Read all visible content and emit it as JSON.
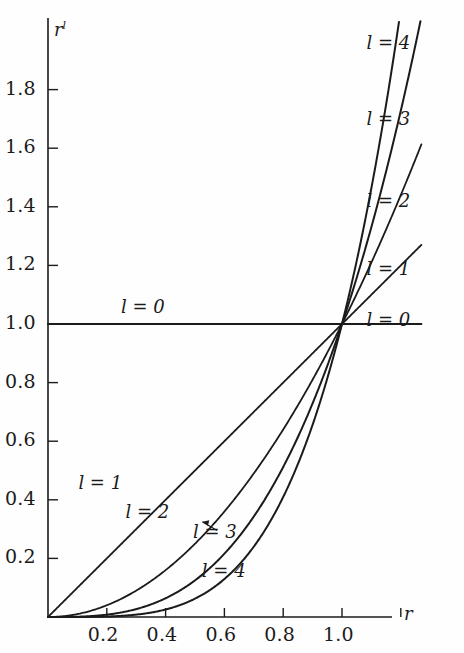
{
  "figure": {
    "background": "#fefefe",
    "ink_color": "#1b1b1b",
    "width": 464,
    "height": 653
  },
  "axes": {
    "x_label": "r",
    "y_label_base": "r",
    "y_label_exponent": "l",
    "x_ticks": [
      {
        "value": 0.2,
        "label": "0.2"
      },
      {
        "value": 0.4,
        "label": "0.4"
      },
      {
        "value": 0.6,
        "label": "0.6"
      },
      {
        "value": 0.8,
        "label": "0.8"
      },
      {
        "value": 1.0,
        "label": "1.0"
      },
      {
        "value": 1.2,
        "label": ""
      }
    ],
    "y_ticks": [
      {
        "value": 0.2,
        "label": "0.2"
      },
      {
        "value": 0.4,
        "label": "0.4"
      },
      {
        "value": 0.6,
        "label": "0.6"
      },
      {
        "value": 0.8,
        "label": "0.8"
      },
      {
        "value": 1.0,
        "label": "1.0"
      },
      {
        "value": 1.2,
        "label": "1.2"
      },
      {
        "value": 1.4,
        "label": "1.4"
      },
      {
        "value": 1.6,
        "label": "1.6"
      },
      {
        "value": 1.8,
        "label": "1.8"
      }
    ],
    "x_range": [
      0.0,
      1.27
    ],
    "y_range": [
      0.0,
      2.04
    ]
  },
  "inline_labels": {
    "left": [
      {
        "id": "l0",
        "text": "l = 0",
        "x": 0.33,
        "y": 1.055
      },
      {
        "id": "l1",
        "text": "l = 1",
        "x": 0.185,
        "y": 0.455
      },
      {
        "id": "l2",
        "text": "l = 2",
        "x": 0.345,
        "y": 0.355
      },
      {
        "id": "l3",
        "text": "l = 3",
        "x": 0.575,
        "y": 0.285,
        "has_arrow": true
      },
      {
        "id": "l4",
        "text": "l = 4",
        "x": 0.605,
        "y": 0.155
      }
    ],
    "right": [
      {
        "id": "r4",
        "text": "l = 4",
        "x": 1.165,
        "y": 1.955
      },
      {
        "id": "r3",
        "text": "l = 3",
        "x": 1.165,
        "y": 1.695
      },
      {
        "id": "r2",
        "text": "l = 2",
        "x": 1.165,
        "y": 1.415
      },
      {
        "id": "r1",
        "text": "l = 1",
        "x": 1.165,
        "y": 1.185
      },
      {
        "id": "r0",
        "text": "l = 0",
        "x": 1.165,
        "y": 1.01
      }
    ]
  },
  "chart_data": {
    "type": "line",
    "title": "",
    "xlabel": "r",
    "ylabel": "r^l",
    "xlim": [
      0.0,
      1.27
    ],
    "ylim": [
      0.0,
      2.04
    ],
    "xticks": [
      0.2,
      0.4,
      0.6,
      0.8,
      1.0,
      1.2
    ],
    "xticklabels": [
      "0.2",
      "0.4",
      "0.6",
      "0.8",
      "1.0",
      ""
    ],
    "yticks": [
      0.2,
      0.4,
      0.6,
      0.8,
      1.0,
      1.2,
      1.4,
      1.6,
      1.8
    ],
    "yticklabels": [
      "0.2",
      "0.4",
      "0.6",
      "0.8",
      "1.0",
      "1.2",
      "1.4",
      "1.6",
      "1.8"
    ],
    "grid": false,
    "legend": "inline-curve-labels",
    "function": "y = r^l",
    "x": [
      0.0,
      0.05,
      0.1,
      0.15,
      0.2,
      0.25,
      0.3,
      0.35,
      0.4,
      0.45,
      0.5,
      0.55,
      0.6,
      0.65,
      0.7,
      0.75,
      0.8,
      0.85,
      0.9,
      0.95,
      1.0,
      1.05,
      1.1,
      1.15,
      1.2
    ],
    "series": [
      {
        "name": "l = 0",
        "exponent": 0,
        "clip_ymax": 2.04,
        "values": [
          1.0,
          1.0,
          1.0,
          1.0,
          1.0,
          1.0,
          1.0,
          1.0,
          1.0,
          1.0,
          1.0,
          1.0,
          1.0,
          1.0,
          1.0,
          1.0,
          1.0,
          1.0,
          1.0,
          1.0,
          1.0,
          1.0,
          1.0,
          1.0,
          1.0
        ]
      },
      {
        "name": "l = 1",
        "exponent": 1,
        "clip_ymax": 2.04,
        "values": [
          0.0,
          0.05,
          0.1,
          0.15,
          0.2,
          0.25,
          0.3,
          0.35,
          0.4,
          0.45,
          0.5,
          0.55,
          0.6,
          0.65,
          0.7,
          0.75,
          0.8,
          0.85,
          0.9,
          0.95,
          1.0,
          1.05,
          1.1,
          1.15,
          1.2
        ]
      },
      {
        "name": "l = 2",
        "exponent": 2,
        "clip_ymax": 2.04,
        "values": [
          0.0,
          0.003,
          0.01,
          0.023,
          0.04,
          0.063,
          0.09,
          0.123,
          0.16,
          0.203,
          0.25,
          0.303,
          0.36,
          0.423,
          0.49,
          0.563,
          0.64,
          0.723,
          0.81,
          0.903,
          1.0,
          1.103,
          1.21,
          1.323,
          1.44
        ]
      },
      {
        "name": "l = 3",
        "exponent": 3,
        "clip_ymax": 2.04,
        "values": [
          0.0,
          0.0,
          0.001,
          0.003,
          0.008,
          0.016,
          0.027,
          0.043,
          0.064,
          0.091,
          0.125,
          0.166,
          0.216,
          0.275,
          0.343,
          0.422,
          0.512,
          0.614,
          0.729,
          0.857,
          1.0,
          1.158,
          1.331,
          1.521,
          1.728
        ]
      },
      {
        "name": "l = 4",
        "exponent": 4,
        "clip_ymax": 2.04,
        "values": [
          0.0,
          0.0,
          0.0,
          0.001,
          0.002,
          0.004,
          0.008,
          0.015,
          0.026,
          0.041,
          0.063,
          0.092,
          0.13,
          0.179,
          0.24,
          0.316,
          0.41,
          0.522,
          0.656,
          0.815,
          1.0,
          1.216,
          1.464,
          1.749,
          2.074
        ]
      }
    ]
  }
}
